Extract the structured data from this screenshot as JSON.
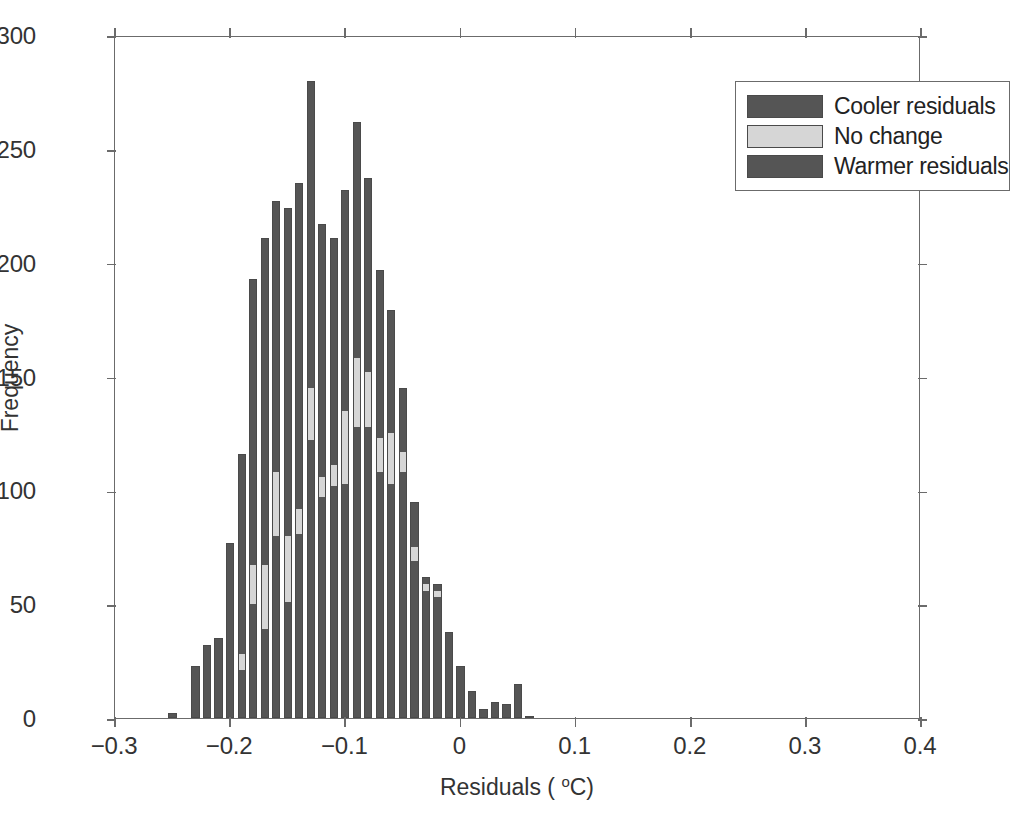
{
  "chart_data": {
    "type": "bar",
    "title": "",
    "subtitle": "",
    "xlabel": "Residuals ( °C)",
    "ylabel": "Frequency",
    "xlim": [
      -0.3,
      0.4
    ],
    "ylim": [
      0,
      300
    ],
    "xticks": [
      -0.3,
      -0.2,
      -0.1,
      0,
      0.1,
      0.2,
      0.3,
      0.4
    ],
    "xticklabels": [
      "−0.3",
      "−0.2",
      "−0.1",
      "0",
      "0.1",
      "0.2",
      "0.3",
      "0.4"
    ],
    "yticks": [
      0,
      50,
      100,
      150,
      200,
      250,
      300
    ],
    "yticklabels": [
      "0",
      "50",
      "100",
      "150",
      "200",
      "250",
      "300"
    ],
    "grid": false,
    "stacked": true,
    "bin_width": 0.01,
    "legend": {
      "position": "top-right",
      "entries": [
        {
          "label": "Cooler residuals",
          "color": "#555555"
        },
        {
          "label": "No change",
          "color": "#d6d6d6"
        },
        {
          "label": "Warmer residuals",
          "color": "#555555"
        }
      ]
    },
    "series": [
      {
        "name": "Cooler residuals",
        "color": "#555555"
      },
      {
        "name": "No change",
        "color": "#d6d6d6"
      },
      {
        "name": "Warmer residuals",
        "color": "#555555"
      }
    ],
    "bins": [
      {
        "x0": -0.255,
        "cooler": 0,
        "nochange": 0,
        "warmer": 2,
        "total": 2
      },
      {
        "x0": -0.245,
        "cooler": 0,
        "nochange": 0,
        "warmer": 0,
        "total": 0
      },
      {
        "x0": -0.235,
        "cooler": 0,
        "nochange": 0,
        "warmer": 23,
        "total": 23
      },
      {
        "x0": -0.225,
        "cooler": 0,
        "nochange": 0,
        "warmer": 32,
        "total": 32
      },
      {
        "x0": -0.215,
        "cooler": 0,
        "nochange": 0,
        "warmer": 35,
        "total": 35
      },
      {
        "x0": -0.205,
        "cooler": 70,
        "nochange": 0,
        "warmer": 7,
        "total": 77
      },
      {
        "x0": -0.195,
        "cooler": 88,
        "nochange": 7,
        "warmer": 21,
        "total": 116
      },
      {
        "x0": -0.185,
        "cooler": 126,
        "nochange": 17,
        "warmer": 50,
        "total": 193
      },
      {
        "x0": -0.175,
        "cooler": 144,
        "nochange": 28,
        "warmer": 39,
        "total": 211
      },
      {
        "x0": -0.165,
        "cooler": 119,
        "nochange": 28,
        "warmer": 80,
        "total": 227
      },
      {
        "x0": -0.155,
        "cooler": 144,
        "nochange": 29,
        "warmer": 51,
        "total": 224
      },
      {
        "x0": -0.145,
        "cooler": 143,
        "nochange": 11,
        "warmer": 81,
        "total": 235
      },
      {
        "x0": -0.135,
        "cooler": 135,
        "nochange": 23,
        "warmer": 122,
        "total": 280
      },
      {
        "x0": -0.125,
        "cooler": 111,
        "nochange": 9,
        "warmer": 97,
        "total": 217
      },
      {
        "x0": -0.115,
        "cooler": 100,
        "nochange": 9,
        "warmer": 102,
        "total": 211
      },
      {
        "x0": -0.105,
        "cooler": 97,
        "nochange": 32,
        "warmer": 103,
        "total": 232
      },
      {
        "x0": -0.095,
        "cooler": 104,
        "nochange": 30,
        "warmer": 128,
        "total": 262
      },
      {
        "x0": -0.085,
        "cooler": 85,
        "nochange": 24,
        "warmer": 128,
        "total": 237
      },
      {
        "x0": -0.075,
        "cooler": 74,
        "nochange": 15,
        "warmer": 108,
        "total": 197
      },
      {
        "x0": -0.065,
        "cooler": 54,
        "nochange": 22,
        "warmer": 103,
        "total": 179
      },
      {
        "x0": -0.055,
        "cooler": 28,
        "nochange": 9,
        "warmer": 108,
        "total": 145
      },
      {
        "x0": -0.045,
        "cooler": 20,
        "nochange": 6,
        "warmer": 69,
        "total": 95
      },
      {
        "x0": -0.035,
        "cooler": 3,
        "nochange": 3,
        "warmer": 56,
        "total": 62
      },
      {
        "x0": -0.025,
        "cooler": 3,
        "nochange": 3,
        "warmer": 53,
        "total": 59
      },
      {
        "x0": -0.015,
        "cooler": 0,
        "nochange": 0,
        "warmer": 38,
        "total": 38
      },
      {
        "x0": -0.005,
        "cooler": 0,
        "nochange": 0,
        "warmer": 23,
        "total": 23
      },
      {
        "x0": 0.005,
        "cooler": 0,
        "nochange": 0,
        "warmer": 12,
        "total": 12
      },
      {
        "x0": 0.015,
        "cooler": 0,
        "nochange": 0,
        "warmer": 4,
        "total": 4
      },
      {
        "x0": 0.025,
        "cooler": 0,
        "nochange": 0,
        "warmer": 7,
        "total": 7
      },
      {
        "x0": 0.035,
        "cooler": 0,
        "nochange": 0,
        "warmer": 6,
        "total": 6
      },
      {
        "x0": 0.045,
        "cooler": 0,
        "nochange": 0,
        "warmer": 15,
        "total": 15
      },
      {
        "x0": 0.055,
        "cooler": 0,
        "nochange": 0,
        "warmer": 1,
        "total": 1
      }
    ],
    "bin_centers": [
      -0.245,
      -0.235,
      -0.225,
      -0.215,
      -0.205,
      -0.195,
      -0.185,
      -0.175,
      -0.165,
      -0.155,
      -0.145,
      -0.135,
      -0.125,
      -0.115,
      -0.105,
      -0.095,
      -0.085,
      -0.075,
      -0.065,
      -0.055,
      -0.045,
      -0.035,
      -0.025,
      -0.015,
      -0.005,
      0.005,
      0.015,
      0.025,
      0.035,
      0.045,
      0.055,
      0.065
    ]
  }
}
